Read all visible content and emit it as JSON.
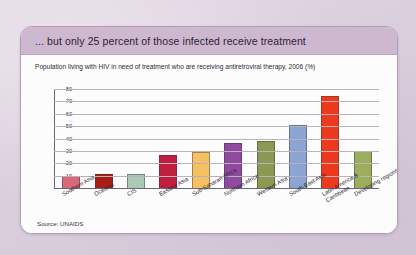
{
  "card": {
    "title": "... but only 25 percent of those infected receive treatment",
    "subtitle": "Population living with HIV in need of treatment who are receiving antiretroviral therapy, 2006 (%)",
    "source": "Source: UNAIDS"
  },
  "colors": {
    "page_background": "#ded2e0",
    "card_background": "#ffffff",
    "header_background": "#cdb8d0",
    "card_border": "#b59bb8",
    "gridline": "#b9b2bd",
    "axis": "#6d6672"
  },
  "chart_data": {
    "type": "bar",
    "title": "Population living with HIV in need of treatment who are receiving antiretroviral therapy, 2006 (%)",
    "xlabel": "",
    "ylabel": "",
    "ylim": [
      0,
      80
    ],
    "yticks": [
      80,
      70,
      60,
      50,
      40,
      30,
      20,
      10,
      0
    ],
    "grid": true,
    "legend": "none",
    "categories": [
      "Southern Asia",
      "Oceania",
      "CIS",
      "Eastern Asia",
      "Sub-Saharan Africa",
      "Northern Africa",
      "Western Asia",
      "South-East Asia",
      "Latin America & Caribbean",
      "Developing regions"
    ],
    "values": [
      10,
      11,
      11,
      27,
      29,
      36,
      38,
      51,
      74,
      30
    ],
    "bar_colors": [
      "#d9697a",
      "#a81f12",
      "#a9c9b4",
      "#bf1f3f",
      "#f5c163",
      "#8e4a9e",
      "#8a9a52",
      "#8aa4d4",
      "#ee3a1c",
      "#9aae5b"
    ]
  }
}
